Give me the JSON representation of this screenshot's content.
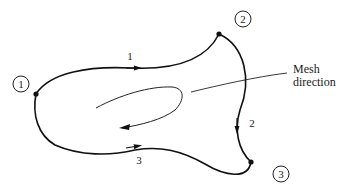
{
  "diagram": {
    "type": "mesh-boundary",
    "nodes": [
      {
        "id": "1",
        "label": "1"
      },
      {
        "id": "2",
        "label": "2"
      },
      {
        "id": "3",
        "label": "3"
      }
    ],
    "edges": [
      {
        "id": "1",
        "label": "1",
        "from": "1",
        "to": "2"
      },
      {
        "id": "2",
        "label": "2",
        "from": "2",
        "to": "3"
      },
      {
        "id": "3",
        "label": "3",
        "from": "3",
        "to": "1"
      }
    ],
    "annotation": {
      "line1": "Mesh",
      "line2": "direction"
    },
    "colors": {
      "stroke": "#111111",
      "text": "#222222"
    }
  }
}
